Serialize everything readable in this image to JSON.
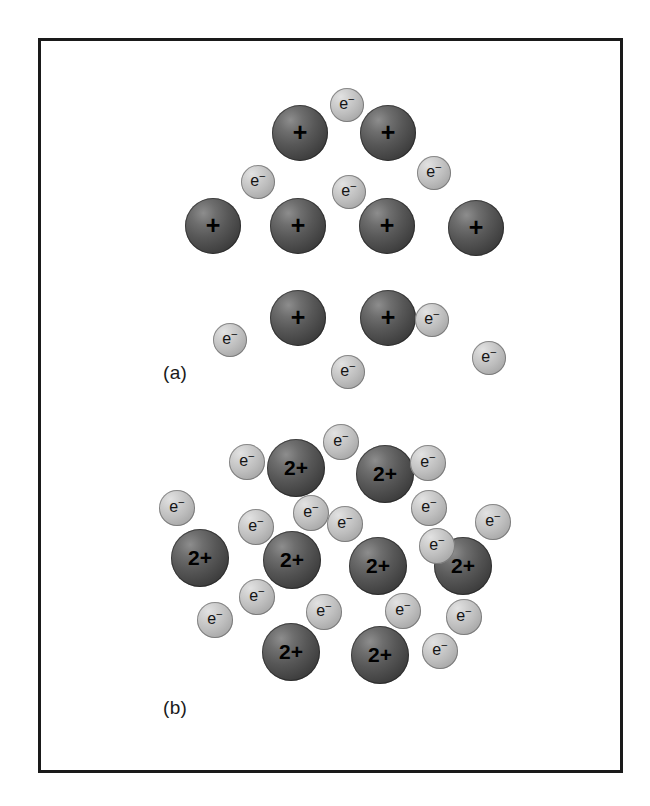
{
  "figure": {
    "background_color": "#ffffff",
    "frame_color": "#1a1a1a",
    "cation_color": "#4a4a4a",
    "electron_color": "#bdbdbd"
  },
  "panels": [
    {
      "id": "panel-a",
      "label": "(a)",
      "label_x": 163,
      "label_y": 362,
      "description": "Group 1 metal lattice: singly charged cations in a sea of delocalized electrons",
      "cation_charge": "+",
      "electron_symbol": "e",
      "electron_superscript": "−",
      "cations": [
        {
          "x": 300,
          "y": 133,
          "r": 28,
          "charge": "+"
        },
        {
          "x": 388,
          "y": 133,
          "r": 28,
          "charge": "+"
        },
        {
          "x": 213,
          "y": 226,
          "r": 28,
          "charge": "+"
        },
        {
          "x": 298,
          "y": 226,
          "r": 28,
          "charge": "+"
        },
        {
          "x": 387,
          "y": 226,
          "r": 28,
          "charge": "+"
        },
        {
          "x": 476,
          "y": 228,
          "r": 28,
          "charge": "+"
        },
        {
          "x": 298,
          "y": 318,
          "r": 28,
          "charge": "+"
        },
        {
          "x": 388,
          "y": 318,
          "r": 28,
          "charge": "+"
        }
      ],
      "electrons": [
        {
          "x": 347,
          "y": 105,
          "r": 17
        },
        {
          "x": 258,
          "y": 182,
          "r": 17
        },
        {
          "x": 349,
          "y": 192,
          "r": 17
        },
        {
          "x": 434,
          "y": 173,
          "r": 17
        },
        {
          "x": 230,
          "y": 340,
          "r": 17
        },
        {
          "x": 348,
          "y": 372,
          "r": 17
        },
        {
          "x": 432,
          "y": 320,
          "r": 17
        },
        {
          "x": 489,
          "y": 358,
          "r": 17
        }
      ]
    },
    {
      "id": "panel-b",
      "label": "(b)",
      "label_x": 163,
      "label_y": 697,
      "description": "Group 2 metal lattice: doubly charged cations with twice as many delocalized electrons",
      "cation_charge": "2+",
      "electron_symbol": "e",
      "electron_superscript": "−",
      "cations": [
        {
          "x": 296,
          "y": 468,
          "r": 29,
          "charge": "2+"
        },
        {
          "x": 385,
          "y": 474,
          "r": 29,
          "charge": "2+"
        },
        {
          "x": 200,
          "y": 558,
          "r": 29,
          "charge": "2+"
        },
        {
          "x": 292,
          "y": 560,
          "r": 29,
          "charge": "2+"
        },
        {
          "x": 378,
          "y": 566,
          "r": 29,
          "charge": "2+"
        },
        {
          "x": 463,
          "y": 566,
          "r": 29,
          "charge": "2+"
        },
        {
          "x": 291,
          "y": 652,
          "r": 29,
          "charge": "2+"
        },
        {
          "x": 380,
          "y": 655,
          "r": 29,
          "charge": "2+"
        }
      ],
      "electrons": [
        {
          "x": 247,
          "y": 462,
          "r": 18
        },
        {
          "x": 341,
          "y": 442,
          "r": 18
        },
        {
          "x": 428,
          "y": 463,
          "r": 18
        },
        {
          "x": 177,
          "y": 508,
          "r": 18
        },
        {
          "x": 256,
          "y": 527,
          "r": 18
        },
        {
          "x": 311,
          "y": 513,
          "r": 18
        },
        {
          "x": 345,
          "y": 524,
          "r": 18
        },
        {
          "x": 429,
          "y": 508,
          "r": 18
        },
        {
          "x": 493,
          "y": 522,
          "r": 18
        },
        {
          "x": 437,
          "y": 546,
          "r": 18
        },
        {
          "x": 257,
          "y": 597,
          "r": 18
        },
        {
          "x": 215,
          "y": 620,
          "r": 18
        },
        {
          "x": 324,
          "y": 612,
          "r": 18
        },
        {
          "x": 403,
          "y": 611,
          "r": 18
        },
        {
          "x": 464,
          "y": 617,
          "r": 18
        },
        {
          "x": 440,
          "y": 651,
          "r": 18
        }
      ]
    }
  ]
}
